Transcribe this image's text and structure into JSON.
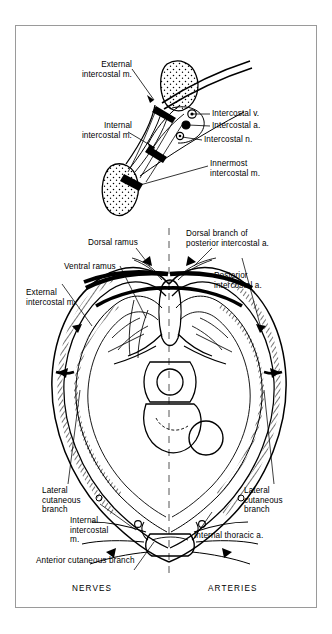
{
  "figure": {
    "background": "#ffffff",
    "border_color": "#9a9a9a",
    "ink": "#000000"
  },
  "upper_diagram": {
    "name": "intercostal-space-detail",
    "labels": {
      "external_intercostal": "External\nintercostal m.",
      "internal_intercostal": "Internal\nintercostal m.",
      "intercostal_vein": "Intercostal v.",
      "intercostal_artery": "Intercostal a.",
      "intercostal_nerve": "Intercostal n.",
      "innermost_intercostal": "Innermost\nintercostal m."
    },
    "neurovascular_bundle": [
      "vein",
      "artery",
      "nerve"
    ]
  },
  "lower_diagram": {
    "name": "thoracic-cross-section",
    "labels": {
      "dorsal_ramus": "Dorsal ramus",
      "dorsal_branch_posterior_intercostal": "Dorsal branch of\nposterior intercostal a.",
      "ventral_ramus": "Ventral ramus",
      "posterior_intercostal_artery": "Posterior\nintercostal a.",
      "external_intercostal": "External\nintercostal m.",
      "lateral_cutaneous_left": "Lateral\ncutaneous\nbranch",
      "lateral_cutaneous_right": "Lateral\ncutaneous\nbranch",
      "internal_intercostal": "Internal\nintercostal\nm.",
      "anterior_cutaneous": "Anterior cutaneous branch",
      "internal_thoracic_artery": "Internal thoracic a."
    },
    "midline": "dashed",
    "captions": {
      "left": "NERVES",
      "right": "ARTERIES"
    }
  }
}
